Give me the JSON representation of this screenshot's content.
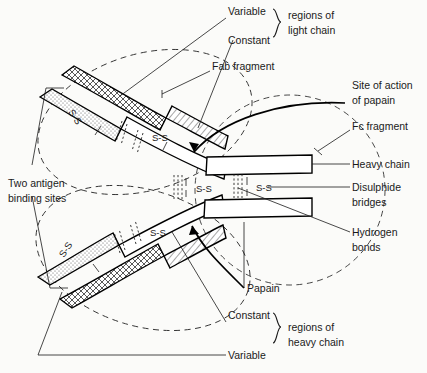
{
  "figure": {
    "background_color": "#fbfbf9",
    "ink_color": "#1a1a1a"
  },
  "labels": {
    "variable_light": "Variable",
    "constant_light": "Constant",
    "regions_light_chain": "regions of\nlight chain",
    "regions_light_chain_line1": "regions of",
    "regions_light_chain_line2": "light chain",
    "fab_fragment": "Fab fragment",
    "site_of_action_line1": "Site of action",
    "site_of_action_line2": "of papain",
    "fc_fragment": "Fc fragment",
    "heavy_chain": "Heavy chain",
    "disulphide_line1": "Disulphide",
    "disulphide_line2": "bridges",
    "hydrogen_line1": "Hydrogen",
    "hydrogen_line2": "bonds",
    "two_antigen_line1": "Two antigen",
    "two_antigen_line2": "binding sites",
    "papain": "Papain",
    "constant_heavy": "Constant",
    "variable_heavy": "Variable",
    "regions_heavy_chain_line1": "regions of",
    "regions_heavy_chain_line2": "heavy chain"
  },
  "bond_labels": {
    "upper_arm_tip": "S-S",
    "upper_arm_mid": "S-S",
    "lower_arm_tip": "S-S",
    "lower_arm_mid": "S-S",
    "hinge_left": "S-S",
    "hinge_right": "S-S"
  },
  "structure": {
    "chains": [
      {
        "name": "light-chain-upper",
        "regions": [
          "variable",
          "constant"
        ],
        "pattern": [
          "cross-hatch",
          "diagonal-hatch"
        ]
      },
      {
        "name": "heavy-chain-upper",
        "regions": [
          "variable",
          "constant"
        ],
        "pattern": [
          "stipple",
          "plain"
        ]
      },
      {
        "name": "heavy-chain-lower",
        "regions": [
          "variable",
          "constant"
        ],
        "pattern": [
          "stipple",
          "plain"
        ]
      },
      {
        "name": "light-chain-lower",
        "regions": [
          "variable",
          "constant"
        ],
        "pattern": [
          "cross-hatch",
          "diagonal-hatch"
        ]
      }
    ],
    "disulphide_bridge_count": 6,
    "hydrogen_bond_groups": 4,
    "antigen_binding_sites": 2,
    "fragments": [
      "Fab",
      "Fab",
      "Fc"
    ]
  }
}
